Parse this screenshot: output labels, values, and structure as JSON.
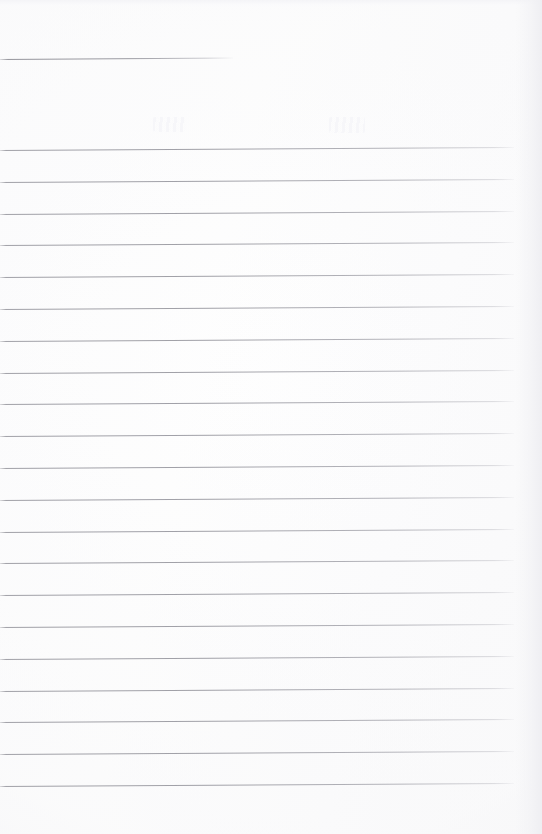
{
  "document": {
    "kind": "scanned-lined-notebook-page",
    "title": "Blank ruled page",
    "content_text": "",
    "width_px": 542,
    "height_px": 834
  },
  "paper": {
    "background_color": "#fdfdfd",
    "edge_shade_color": "#f2f2f5",
    "rule_color": "#8e8e96",
    "ghost_mark_color": "#f6f6f9"
  },
  "heading_rule": {
    "label": "heading underline",
    "top_px": 59,
    "left_px": 0,
    "width_px": 233,
    "slope_deg": -0.35
  },
  "ruled_area": {
    "label": "ruled writing lines",
    "first_line_top_px": 150,
    "line_spacing_px": 31.8,
    "line_count": 21,
    "left_px": 0,
    "right_px": 514,
    "slope_deg": -0.33,
    "lines": [
      {
        "index": 1,
        "top_px": 150.0,
        "width_px": 514
      },
      {
        "index": 2,
        "top_px": 181.8,
        "width_px": 514
      },
      {
        "index": 3,
        "top_px": 213.6,
        "width_px": 514
      },
      {
        "index": 4,
        "top_px": 245.4,
        "width_px": 514
      },
      {
        "index": 5,
        "top_px": 277.2,
        "width_px": 514
      },
      {
        "index": 6,
        "top_px": 309.0,
        "width_px": 514
      },
      {
        "index": 7,
        "top_px": 340.8,
        "width_px": 514
      },
      {
        "index": 8,
        "top_px": 372.6,
        "width_px": 514
      },
      {
        "index": 9,
        "top_px": 404.4,
        "width_px": 514
      },
      {
        "index": 10,
        "top_px": 436.2,
        "width_px": 514
      },
      {
        "index": 11,
        "top_px": 468.0,
        "width_px": 514
      },
      {
        "index": 12,
        "top_px": 499.8,
        "width_px": 514
      },
      {
        "index": 13,
        "top_px": 531.6,
        "width_px": 514
      },
      {
        "index": 14,
        "top_px": 563.4,
        "width_px": 514
      },
      {
        "index": 15,
        "top_px": 595.2,
        "width_px": 514
      },
      {
        "index": 16,
        "top_px": 627.0,
        "width_px": 514
      },
      {
        "index": 17,
        "top_px": 658.8,
        "width_px": 514
      },
      {
        "index": 18,
        "top_px": 690.6,
        "width_px": 514
      },
      {
        "index": 19,
        "top_px": 722.4,
        "width_px": 514
      },
      {
        "index": 20,
        "top_px": 754.2,
        "width_px": 514
      },
      {
        "index": 21,
        "top_px": 786.0,
        "width_px": 514
      }
    ]
  },
  "ghost_marks": [
    {
      "label": "faint bleed-through mark left",
      "left_px": 153,
      "top_px": 117,
      "width_px": 33,
      "height_px": 15
    },
    {
      "label": "faint bleed-through mark right",
      "left_px": 329,
      "top_px": 117,
      "width_px": 36,
      "height_px": 16
    }
  ],
  "bottom_margin": {
    "label": "blank area below last rule",
    "top_px": 787,
    "height_px": 47
  }
}
